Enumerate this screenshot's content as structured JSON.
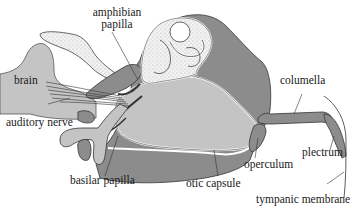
{
  "diagram": {
    "type": "anatomical",
    "colors": {
      "dark_tissue": "#8c8c8c",
      "light_tissue": "#c4c4c4",
      "stippled": "#efefef",
      "outline": "#3a3a3a",
      "background": "#ffffff"
    },
    "labels": {
      "amphibian_papilla_line1": "amphibian",
      "amphibian_papilla_line2": "papilla",
      "brain": "brain",
      "auditory_nerve": "auditory nerve",
      "basilar_papilla": "basilar papilla",
      "otic_capsule": "otic capsule",
      "operculum": "operculum",
      "columella": "columella",
      "plectrum": "plectrum",
      "tympanic_membrane": "tympanic membrane"
    }
  }
}
